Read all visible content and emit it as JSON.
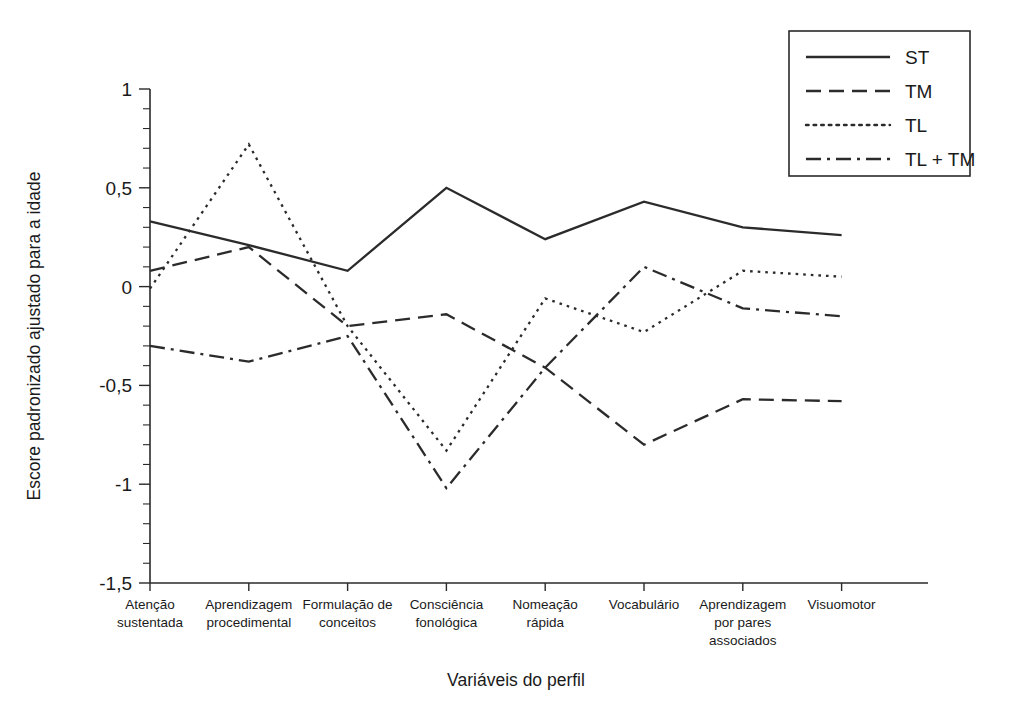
{
  "chart_data": {
    "type": "line",
    "title": "",
    "xlabel": "Variáveis do perfil",
    "ylabel": "Escore padronizado ajustado para a idade",
    "ylim": [
      -1.5,
      1
    ],
    "yticks": [
      1,
      0.5,
      0,
      -0.5,
      -1,
      -1.5
    ],
    "ytick_labels": [
      "1",
      "0,5",
      "0",
      "-0,5",
      "-1",
      "-1,5"
    ],
    "minor_ticks_per_interval": 5,
    "grid": false,
    "legend_position": "top-right",
    "categories": [
      "Atenção sustentada",
      "Aprendizagem procedimental",
      "Formulação de conceitos",
      "Consciência fonológica",
      "Nomeação rápida",
      "Vocabulário",
      "Aprendizagem por pares associados",
      "Visuomotor"
    ],
    "category_lines": [
      [
        "Atenção",
        "sustentada"
      ],
      [
        "Aprendizagem",
        "procedimental"
      ],
      [
        "Formulação de",
        "conceitos"
      ],
      [
        "Consciência",
        "fonológica"
      ],
      [
        "Nomeação",
        "rápida"
      ],
      [
        "Vocabulário"
      ],
      [
        "Aprendizagem",
        "por pares",
        "associados"
      ],
      [
        "Visuomotor"
      ]
    ],
    "series": [
      {
        "name": "ST",
        "dash": "solid",
        "values": [
          0.33,
          0.21,
          0.08,
          0.5,
          0.24,
          0.43,
          0.3,
          0.26
        ]
      },
      {
        "name": "TM",
        "dash": "dashed",
        "values": [
          0.08,
          0.2,
          -0.2,
          -0.14,
          -0.41,
          -0.8,
          -0.57,
          -0.58
        ]
      },
      {
        "name": "TL",
        "dash": "dotted",
        "values": [
          -0.01,
          0.72,
          -0.2,
          -0.83,
          -0.06,
          -0.23,
          0.08,
          0.05
        ]
      },
      {
        "name": "TL + TM",
        "dash": "dashdot",
        "values": [
          -0.3,
          -0.38,
          -0.25,
          -1.02,
          -0.41,
          0.1,
          -0.11,
          -0.15
        ]
      }
    ]
  },
  "legend": {
    "entries": [
      {
        "label": "ST",
        "dash": "solid"
      },
      {
        "label": "TM",
        "dash": "dashed"
      },
      {
        "label": "TL",
        "dash": "dotted"
      },
      {
        "label": "TL + TM",
        "dash": "dashdot"
      }
    ]
  },
  "colors": {
    "ink": "#2a2a2a",
    "background": "#ffffff"
  }
}
